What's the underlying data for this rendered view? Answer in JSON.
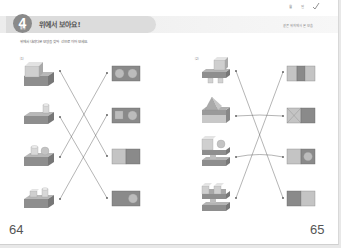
{
  "header": {
    "unit_number": "4",
    "unit_tag": "활동",
    "title": "위에서 보아요!",
    "hint": "같은 위치에서 본 모습",
    "date_fields": [
      "월",
      "일"
    ],
    "check_icon": "check-mark-icon"
  },
  "instructions": "위에서 내려다본 모양을 찾아 선으로 이어 보세요.",
  "sections": [
    {
      "label": "⑴",
      "page_number": "64",
      "objects": [
        {
          "name": "cube-on-slab",
          "description": "큐브가 올려진 판"
        },
        {
          "name": "cylinder-on-slab",
          "description": "원기둥이 올려진 판"
        },
        {
          "name": "cylinder-and-sphere-on-slab",
          "description": "원기둥과 구가 올려진 판"
        },
        {
          "name": "cube-and-cylinder-on-slab",
          "description": "큐브와 원기둥이 올려진 판"
        }
      ],
      "top_views": [
        {
          "name": "two-circles",
          "pattern": "circle-circle"
        },
        {
          "name": "square-circle",
          "pattern": "square-circle"
        },
        {
          "name": "light-dark-halves",
          "pattern": "light-dark"
        },
        {
          "name": "dark-with-circle",
          "pattern": "dark-circle-right"
        }
      ],
      "connections": [
        [
          0,
          2
        ],
        [
          1,
          3
        ],
        [
          2,
          0
        ],
        [
          3,
          1
        ]
      ]
    },
    {
      "label": "⑵",
      "page_number": "65",
      "objects": [
        {
          "name": "cube-on-legs",
          "description": "다리 위의 큐브 구조물"
        },
        {
          "name": "pyramid-on-block",
          "description": "삼각뿔이 올려진 블록"
        },
        {
          "name": "cube-sphere-stack",
          "description": "큐브와 구가 쌓인 구조물"
        },
        {
          "name": "castle-stack",
          "description": "성 모양 쌓기"
        }
      ],
      "top_views": [
        {
          "name": "three-stripes",
          "pattern": "light-dark-light"
        },
        {
          "name": "x-and-dark",
          "pattern": "x-dark"
        },
        {
          "name": "light-and-circle",
          "pattern": "light-circle"
        },
        {
          "name": "dark-light-halves",
          "pattern": "dark-light"
        }
      ],
      "connections": [
        [
          0,
          3
        ],
        [
          1,
          1
        ],
        [
          2,
          2
        ],
        [
          3,
          0
        ]
      ]
    }
  ],
  "colors": {
    "line": "#555555",
    "shape_dark": "#8a8a8a",
    "shape_mid": "#a6a6a6",
    "shape_light": "#c8c8c8",
    "header_band": "#e4e4e4"
  }
}
